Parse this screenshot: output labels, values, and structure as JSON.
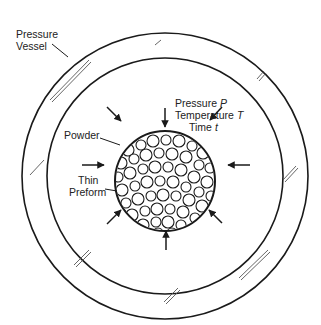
{
  "diagram": {
    "title": "",
    "labels": {
      "pressure_vessel": [
        "Pressure",
        "Vessel"
      ],
      "conditions": {
        "pressure_word": "Pressure",
        "pressure_symbol": "P",
        "temperature_word": "Temperature",
        "temperature_symbol": "T",
        "time_word": "Time",
        "time_symbol": "t"
      },
      "powder": "Powder",
      "thin_preform": [
        "Thin",
        "Preform"
      ]
    },
    "colors": {
      "line": "#1a1a1a",
      "background": "#ffffff",
      "glass_hatch": "#555555"
    },
    "geometry": {
      "outer_circle": {
        "cx": 165,
        "cy": 176,
        "r": 143
      },
      "inner_circle": {
        "cx": 165,
        "cy": 176,
        "r": 118
      },
      "powder_circle": {
        "cx": 165,
        "cy": 181,
        "r": 50
      }
    },
    "arrows_count": 8
  }
}
